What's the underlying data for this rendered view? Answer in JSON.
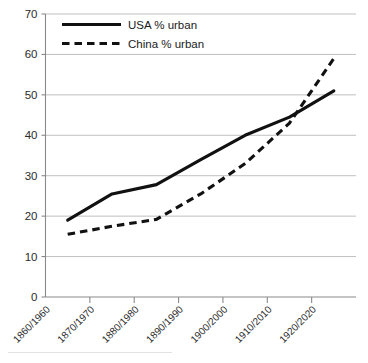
{
  "chart_data": {
    "type": "line",
    "title": "",
    "subtitle": "",
    "xlabel": "",
    "ylabel": "",
    "categories": [
      "1860/1960",
      "1870/1970",
      "1880/1980",
      "1890/1990",
      "1900/2000",
      "1910/2010",
      "1920/2020"
    ],
    "series": [
      {
        "name": "USA % urban",
        "style": "solid",
        "color": "#111111",
        "values": [
          19,
          25.5,
          27.8,
          34,
          40,
          44.5,
          51
        ]
      },
      {
        "name": "China % urban",
        "style": "dashed",
        "color": "#111111",
        "values": [
          15.5,
          17.5,
          19.2,
          25.5,
          33,
          43,
          59
        ]
      }
    ],
    "ylim": [
      0,
      70
    ],
    "ytick_values": [
      0,
      10,
      20,
      30,
      40,
      50,
      60,
      70
    ],
    "ytick_labels": [
      "0",
      "10",
      "20",
      "30",
      "40",
      "50",
      "60",
      "70"
    ],
    "grid": true,
    "grid_axis": "y",
    "legend_position": "top-left",
    "xtick_label_rotation": -45,
    "background_color": "#ffffff",
    "gridline_color": "#b9b9b9",
    "axis_color": "#8a8a8a"
  },
  "legend": {
    "entries": [
      {
        "label": "USA % urban"
      },
      {
        "label": "China % urban"
      }
    ]
  }
}
